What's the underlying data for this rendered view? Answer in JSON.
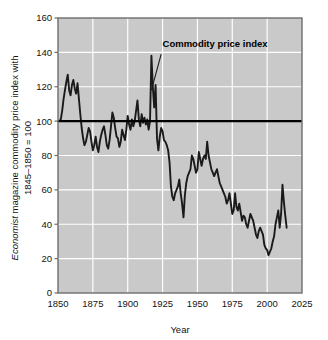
{
  "figure": {
    "background_color": "#ffffff",
    "plot_background_color": "#c9c9c9",
    "plot_border_color": "#6e6e6e",
    "gridline_color": "#ffffff",
    "series_color": "#1a1a1a",
    "reference_line_color": "#000000",
    "text_color": "#141414"
  },
  "chart_data": {
    "type": "line",
    "title": "",
    "xlabel": "Year",
    "ylabel_line1": "Economist",
    "ylabel_line1_rest": " magazine commodity price index with",
    "ylabel_line2": "1845–1850 = 100",
    "xlim": [
      1850,
      2025
    ],
    "ylim": [
      0,
      160
    ],
    "xticks": [
      1850,
      1875,
      1900,
      1925,
      1950,
      1975,
      2000,
      2025
    ],
    "yticks": [
      0,
      20,
      40,
      60,
      80,
      100,
      120,
      140,
      160
    ],
    "grid": true,
    "grid_axes": "both",
    "legend": false,
    "annotations": [
      {
        "text": "Commodity price index",
        "text_x": 1925,
        "text_y": 143,
        "leader_from_x": 1924,
        "leader_from_y": 139,
        "leader_to_x": 1917,
        "leader_to_y": 118
      }
    ],
    "reference_lines": [
      {
        "name": "baseline-100",
        "orientation": "horizontal",
        "value": 100,
        "from_x": 1850,
        "to_x": 2025
      }
    ],
    "series": [
      {
        "name": "Commodity price index",
        "xlabel": "Year",
        "ylabel": "Index (1845-1850 = 100)",
        "x": [
          1850,
          1851,
          1852,
          1853,
          1854,
          1855,
          1856,
          1857,
          1858,
          1859,
          1860,
          1861,
          1862,
          1863,
          1864,
          1865,
          1866,
          1867,
          1868,
          1869,
          1870,
          1871,
          1872,
          1873,
          1874,
          1875,
          1876,
          1877,
          1878,
          1879,
          1880,
          1881,
          1882,
          1883,
          1884,
          1885,
          1886,
          1887,
          1888,
          1889,
          1890,
          1891,
          1892,
          1893,
          1894,
          1895,
          1896,
          1897,
          1898,
          1899,
          1900,
          1901,
          1902,
          1903,
          1904,
          1905,
          1906,
          1907,
          1908,
          1909,
          1910,
          1911,
          1912,
          1913,
          1914,
          1915,
          1916,
          1917,
          1918,
          1919,
          1920,
          1921,
          1922,
          1923,
          1924,
          1925,
          1926,
          1927,
          1928,
          1929,
          1930,
          1931,
          1932,
          1933,
          1934,
          1935,
          1936,
          1937,
          1938,
          1939,
          1940,
          1941,
          1942,
          1943,
          1944,
          1945,
          1946,
          1947,
          1948,
          1949,
          1950,
          1951,
          1952,
          1953,
          1954,
          1955,
          1956,
          1957,
          1958,
          1959,
          1960,
          1961,
          1962,
          1963,
          1964,
          1965,
          1966,
          1967,
          1968,
          1969,
          1970,
          1971,
          1972,
          1973,
          1974,
          1975,
          1976,
          1977,
          1978,
          1979,
          1980,
          1981,
          1982,
          1983,
          1984,
          1985,
          1986,
          1987,
          1988,
          1989,
          1990,
          1991,
          1992,
          1993,
          1994,
          1995,
          1996,
          1997,
          1998,
          1999,
          2000,
          2001,
          2002,
          2003,
          2004,
          2005,
          2006,
          2007,
          2008,
          2009,
          2010,
          2011,
          2012,
          2013,
          2014
        ],
        "y": [
          100,
          100,
          101,
          106,
          113,
          118,
          123,
          127,
          118,
          115,
          121,
          124,
          119,
          116,
          122,
          113,
          104,
          96,
          90,
          86,
          88,
          92,
          96,
          94,
          88,
          83,
          86,
          91,
          85,
          82,
          88,
          92,
          95,
          97,
          92,
          86,
          84,
          89,
          97,
          105,
          102,
          96,
          91,
          90,
          85,
          88,
          95,
          92,
          89,
          95,
          103,
          98,
          95,
          101,
          97,
          100,
          106,
          112,
          101,
          97,
          104,
          99,
          102,
          98,
          101,
          95,
          100,
          138,
          120,
          108,
          121,
          90,
          83,
          91,
          96,
          94,
          89,
          88,
          86,
          83,
          76,
          62,
          56,
          54,
          58,
          60,
          62,
          66,
          58,
          52,
          44,
          57,
          64,
          68,
          70,
          72,
          80,
          78,
          74,
          70,
          72,
          82,
          78,
          74,
          78,
          80,
          78,
          88,
          80,
          76,
          72,
          70,
          68,
          70,
          72,
          68,
          64,
          62,
          60,
          58,
          56,
          52,
          54,
          58,
          52,
          46,
          48,
          58,
          50,
          48,
          52,
          47,
          42,
          45,
          44,
          40,
          38,
          42,
          46,
          44,
          42,
          38,
          34,
          32,
          36,
          38,
          36,
          34,
          28,
          26,
          25,
          22,
          24,
          26,
          30,
          33,
          40,
          44,
          48,
          38,
          46,
          63,
          53,
          45,
          38
        ]
      }
    ]
  }
}
